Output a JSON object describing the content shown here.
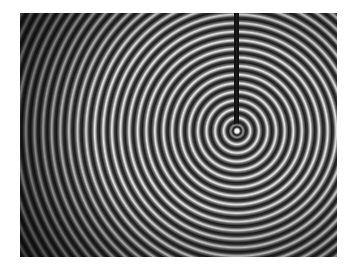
{
  "image": {
    "subject": "concentric water ripples from a vertical rod",
    "colors": {
      "background": "#ffffff",
      "ripple_dark": "#1c1c1c",
      "ripple_light": "#e8e8e8",
      "rod": "#0c0c0c"
    }
  }
}
